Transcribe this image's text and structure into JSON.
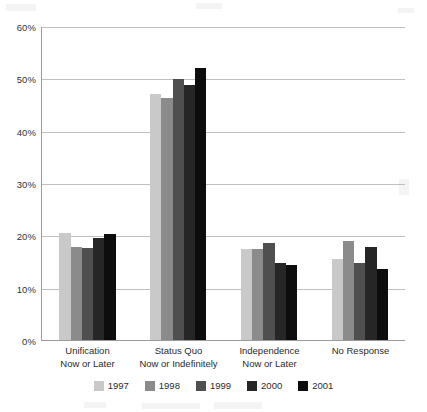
{
  "chart_data": {
    "type": "bar",
    "title": "",
    "subtitle": "",
    "xlabel": "",
    "ylabel": "",
    "ylim": [
      0,
      60
    ],
    "ytick_values": [
      0,
      10,
      20,
      30,
      40,
      50,
      60
    ],
    "ytick_labels": [
      "0%",
      "10%",
      "20%",
      "30%",
      "40%",
      "50%",
      "60%"
    ],
    "grid": true,
    "legend_position": "bottom",
    "categories": [
      "Unification Now or Later",
      "Status Quo Now or Indefinitely",
      "Independence Now or Later",
      "No Response"
    ],
    "category_lines": [
      [
        "Unification",
        "Now or Later"
      ],
      [
        "Status Quo",
        "Now or Indefinitely"
      ],
      [
        "Independence",
        "Now or Later"
      ],
      [
        "No Response",
        ""
      ]
    ],
    "series": [
      {
        "name": "1997",
        "color": "#c9c9c9",
        "values": [
          20.5,
          47.0,
          17.3,
          15.5
        ]
      },
      {
        "name": "1998",
        "color": "#8b8b8b",
        "values": [
          17.8,
          46.3,
          17.4,
          19.0
        ]
      },
      {
        "name": "1999",
        "color": "#4f4f4f",
        "values": [
          17.5,
          49.9,
          18.5,
          14.7
        ]
      },
      {
        "name": "2000",
        "color": "#262626",
        "values": [
          19.4,
          48.8,
          14.7,
          17.7
        ]
      },
      {
        "name": "2001",
        "color": "#0d0d0d",
        "values": [
          20.3,
          52.0,
          14.4,
          13.5
        ]
      }
    ]
  },
  "axis": {
    "y_unit": "%"
  },
  "legend": {
    "entries": [
      "1997",
      "1998",
      "1999",
      "2000",
      "2001"
    ]
  }
}
